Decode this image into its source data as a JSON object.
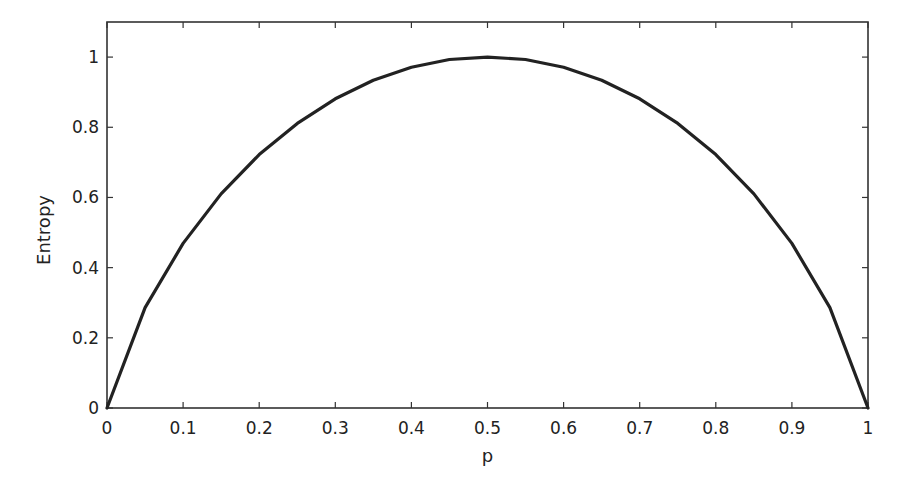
{
  "chart_data": {
    "type": "line",
    "title": "",
    "xlabel": "p",
    "ylabel": "Entropy",
    "xlim": [
      0,
      1
    ],
    "ylim": [
      0,
      1.1
    ],
    "grid": false,
    "legend": null,
    "xticks": [
      0,
      0.1,
      0.2,
      0.3,
      0.4,
      0.5,
      0.6,
      0.7,
      0.8,
      0.9,
      1
    ],
    "xtick_labels": [
      "0",
      "0.1",
      "0.2",
      "0.3",
      "0.4",
      "0.5",
      "0.6",
      "0.7",
      "0.8",
      "0.9",
      "1"
    ],
    "yticks": [
      0,
      0.2,
      0.4,
      0.6,
      0.8,
      1
    ],
    "ytick_labels": [
      "0",
      "0.2",
      "0.4",
      "0.6",
      "0.8",
      "1"
    ],
    "series": [
      {
        "name": "Entropy",
        "color": "#222222",
        "x": [
          0,
          0.05,
          0.1,
          0.15,
          0.2,
          0.25,
          0.3,
          0.35,
          0.4,
          0.45,
          0.5,
          0.55,
          0.6,
          0.65,
          0.7,
          0.75,
          0.8,
          0.85,
          0.9,
          0.95,
          1
        ],
        "y": [
          0,
          0.286,
          0.469,
          0.61,
          0.722,
          0.811,
          0.881,
          0.934,
          0.971,
          0.993,
          1.0,
          0.993,
          0.971,
          0.934,
          0.881,
          0.811,
          0.722,
          0.61,
          0.469,
          0.286,
          0
        ]
      }
    ]
  },
  "layout": {
    "plot_left": 107,
    "plot_right": 868,
    "plot_top": 22,
    "plot_bottom": 408,
    "line_color": "#222222",
    "frame_color": "#333333"
  }
}
